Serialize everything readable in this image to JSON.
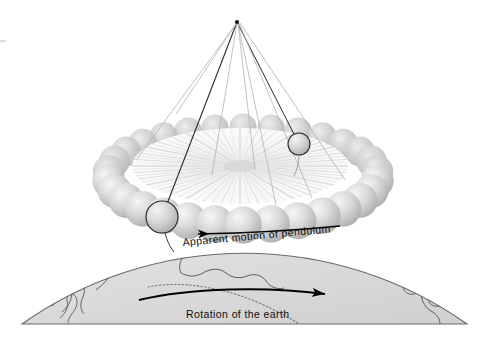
{
  "figure": {
    "background_color": "#ffffff",
    "width": 489,
    "height": 346
  },
  "labels": {
    "apparent_motion": "Apparent motion of pendulum",
    "rotation_of_earth": "Rotation of the earth"
  },
  "colors": {
    "background": "#ffffff",
    "globe_fill": "#d9d9d9",
    "globe_outline": "#555555",
    "coastline": "#4a4a4a",
    "ring_sphere_light": "#f2f2f2",
    "ring_sphere_mid": "#c9c9c9",
    "ring_sphere_dark": "#a8a8a8",
    "disc_light": "#fbfbfb",
    "disc_stripe": "#dcdcdc",
    "bob_outline": "#222222",
    "string_dark": "#2b2b2b",
    "string_light": "#b3b3b3",
    "arrow": "#000000",
    "text": "#0d0d0d"
  },
  "pendulum": {
    "apex": {
      "x": 237,
      "y": 22
    },
    "bob_near": {
      "cx": 162,
      "cy": 217,
      "r": 16
    },
    "bob_far": {
      "cx": 299,
      "cy": 144,
      "r": 11
    },
    "string_count": 9,
    "strings": [
      {
        "x1": 237,
        "y1": 22,
        "x2": 162,
        "y2": 217,
        "shade": "dark",
        "width": 1.1
      },
      {
        "x1": 237,
        "y1": 22,
        "x2": 299,
        "y2": 144,
        "shade": "dark",
        "width": 1.0
      },
      {
        "x1": 236,
        "y1": 24,
        "x2": 137,
        "y2": 159,
        "shade": "light",
        "width": 0.8
      },
      {
        "x1": 236,
        "y1": 24,
        "x2": 176,
        "y2": 114,
        "shade": "light",
        "width": 0.8
      },
      {
        "x1": 237,
        "y1": 23,
        "x2": 212,
        "y2": 175,
        "shade": "light",
        "width": 0.8
      },
      {
        "x1": 238,
        "y1": 23,
        "x2": 255,
        "y2": 170,
        "shade": "light",
        "width": 0.8
      },
      {
        "x1": 238,
        "y1": 23,
        "x2": 276,
        "y2": 205,
        "shade": "light",
        "width": 0.8
      },
      {
        "x1": 239,
        "y1": 23,
        "x2": 312,
        "y2": 198,
        "shade": "light",
        "width": 0.8
      },
      {
        "x1": 240,
        "y1": 23,
        "x2": 345,
        "y2": 180,
        "shade": "light",
        "width": 0.8
      }
    ]
  },
  "ring": {
    "center": {
      "x": 243,
      "y": 176
    },
    "radius_x": 135,
    "radius_y": 49,
    "sphere_count": 30,
    "sphere_radius": 17,
    "top_y": 127,
    "bottom_y": 225,
    "left_x": 108,
    "right_x": 378
  },
  "disc": {
    "center": {
      "x": 240,
      "y": 166
    },
    "radius_x": 108,
    "radius_y": 38,
    "stripe_count": 72
  },
  "globe": {
    "circle_center": {
      "x": 244,
      "y": 580
    },
    "circle_radius": 385,
    "baseline_y": 324,
    "left_x": 22,
    "right_x": 467
  },
  "arrows": {
    "apparent_motion": {
      "direction": "left",
      "from": {
        "x": 338,
        "y": 226
      },
      "to": {
        "x": 188,
        "y": 235
      }
    },
    "rotation_of_earth": {
      "direction": "right",
      "from": {
        "x": 140,
        "y": 300
      },
      "to": {
        "x": 340,
        "y": 295
      }
    }
  }
}
